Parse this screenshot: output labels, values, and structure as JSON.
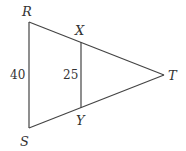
{
  "figure": {
    "points": {
      "R": {
        "label": "R",
        "x": 29,
        "y": 22
      },
      "S": {
        "label": "S",
        "x": 29,
        "y": 128
      },
      "T": {
        "label": "T",
        "x": 164,
        "y": 75
      },
      "X": {
        "label": "X",
        "x": 81,
        "y": 42
      },
      "Y": {
        "label": "Y",
        "x": 81,
        "y": 108
      }
    },
    "segments": [
      {
        "from": "R",
        "to": "S",
        "length_label": "40"
      },
      {
        "from": "X",
        "to": "Y",
        "length_label": "25"
      },
      {
        "from": "R",
        "to": "T"
      },
      {
        "from": "S",
        "to": "T"
      }
    ],
    "labels": {
      "R": "R",
      "S": "S",
      "T": "T",
      "X": "X",
      "Y": "Y",
      "RS_length": "40",
      "XY_length": "25"
    },
    "colors": {
      "line": "#444444",
      "text": "#333333",
      "background": "#ffffff"
    }
  }
}
